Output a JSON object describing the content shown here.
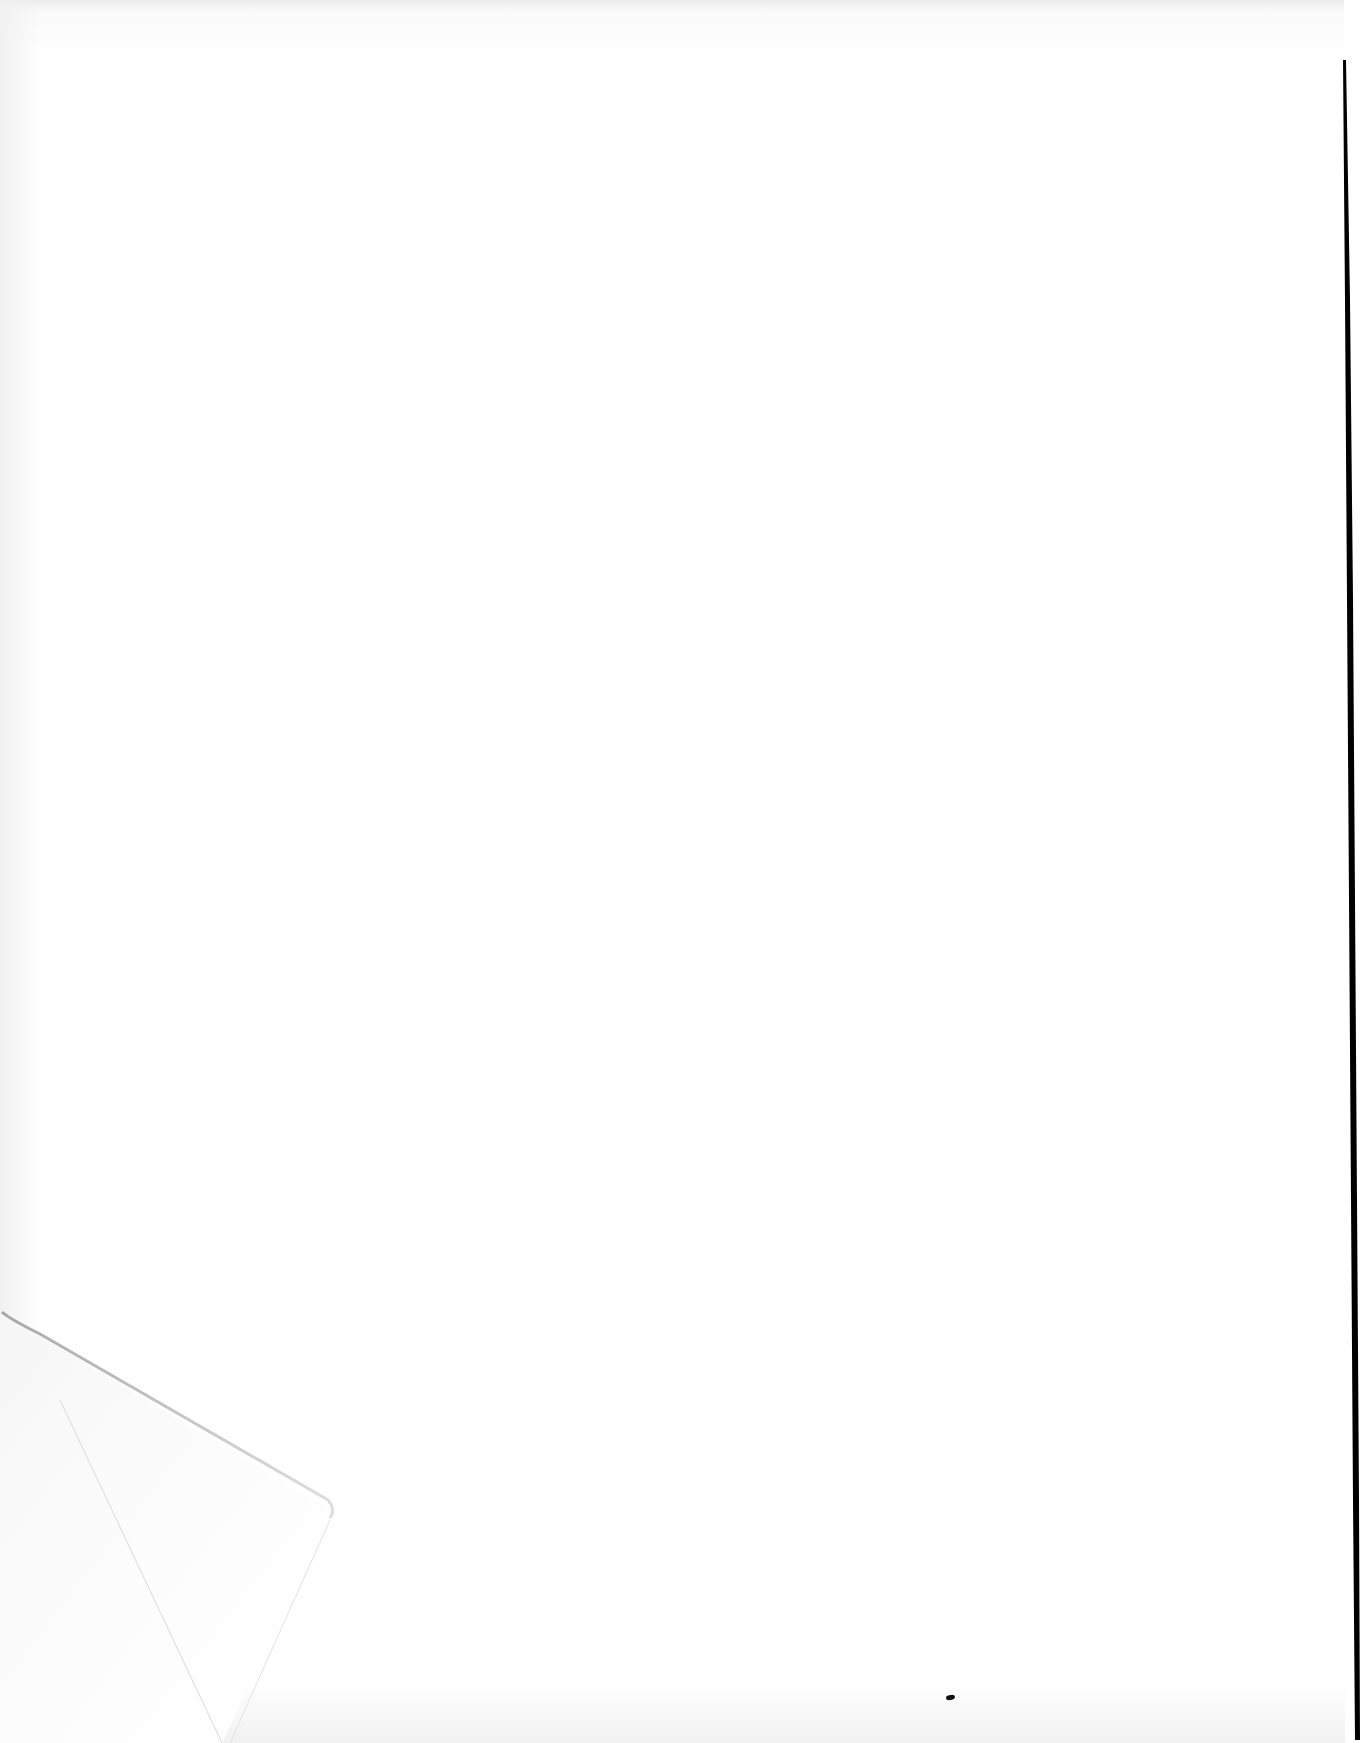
{
  "document": {
    "type": "scanned-page",
    "content": "",
    "blank": true
  },
  "colors": {
    "paper": "#ffffff",
    "edge_shadow": "#000000",
    "fold_shadow": "#cfcfcf"
  }
}
